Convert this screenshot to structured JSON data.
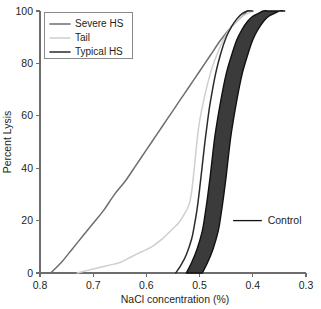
{
  "chart_data": {
    "type": "line",
    "title": "",
    "xlabel": "NaCl concentration (%)",
    "ylabel": "Percent Lysis",
    "xlim": [
      0.8,
      0.3
    ],
    "ylim": [
      0,
      100
    ],
    "x_reversed": true,
    "grid": false,
    "legend_position": "top-left",
    "xticks": [
      "0.8",
      "0.7",
      "0.6",
      "0.5",
      "0.4",
      "0.3"
    ],
    "xtick_values": [
      0.8,
      0.7,
      0.6,
      0.5,
      0.4,
      0.3
    ],
    "yticks": [
      "0",
      "20",
      "40",
      "60",
      "80",
      "100"
    ],
    "ytick_values": [
      0,
      20,
      40,
      60,
      80,
      100
    ],
    "series": [
      {
        "name": "Severe HS",
        "color": "#6e6e6e",
        "x": [
          0.78,
          0.76,
          0.74,
          0.72,
          0.7,
          0.68,
          0.66,
          0.64,
          0.62,
          0.6,
          0.58,
          0.56,
          0.54,
          0.52,
          0.5,
          0.48,
          0.46,
          0.44,
          0.42,
          0.41,
          0.405
        ],
        "values": [
          0,
          4,
          9,
          14,
          19,
          24,
          30,
          35,
          41,
          47,
          53,
          59,
          65,
          71,
          77,
          83,
          89,
          94,
          98,
          100,
          100
        ]
      },
      {
        "name": "Tail",
        "color": "#cfcfcf",
        "x": [
          0.73,
          0.71,
          0.69,
          0.67,
          0.65,
          0.63,
          0.61,
          0.59,
          0.57,
          0.55,
          0.54,
          0.53,
          0.52,
          0.515,
          0.51,
          0.505,
          0.5,
          0.49,
          0.48,
          0.47,
          0.46,
          0.45,
          0.44,
          0.43,
          0.42,
          0.41,
          0.4
        ],
        "values": [
          0,
          1,
          2,
          3,
          4,
          6,
          8,
          10,
          13,
          17,
          19,
          22,
          26,
          31,
          40,
          50,
          58,
          68,
          76,
          82,
          87,
          91,
          94,
          96,
          98,
          99,
          100
        ]
      },
      {
        "name": "Typical HS",
        "color": "#2b2b2b",
        "x": [
          0.545,
          0.535,
          0.525,
          0.515,
          0.51,
          0.505,
          0.5,
          0.495,
          0.49,
          0.485,
          0.48,
          0.47,
          0.46,
          0.45,
          0.44,
          0.43,
          0.42,
          0.41,
          0.4
        ],
        "values": [
          0,
          3,
          7,
          13,
          18,
          24,
          32,
          41,
          50,
          58,
          65,
          76,
          84,
          90,
          94,
          97,
          99,
          100,
          100
        ]
      }
    ],
    "bands": [
      {
        "name": "Control",
        "fill": "#3b3b3b",
        "stroke": "#111111",
        "lower_x": [
          0.525,
          0.515,
          0.505,
          0.495,
          0.49,
          0.485,
          0.48,
          0.475,
          0.47,
          0.46,
          0.45,
          0.44,
          0.43,
          0.42,
          0.41,
          0.4,
          0.39,
          0.38,
          0.37
        ],
        "lower_values": [
          0,
          4,
          9,
          16,
          22,
          29,
          37,
          46,
          54,
          66,
          76,
          83,
          89,
          93,
          96,
          98,
          99,
          100,
          100
        ],
        "upper_x": [
          0.495,
          0.485,
          0.475,
          0.465,
          0.46,
          0.455,
          0.45,
          0.445,
          0.44,
          0.43,
          0.42,
          0.41,
          0.4,
          0.39,
          0.38,
          0.37,
          0.36,
          0.35,
          0.34
        ],
        "upper_values": [
          0,
          4,
          9,
          16,
          22,
          29,
          37,
          46,
          54,
          66,
          76,
          83,
          89,
          93,
          96,
          98,
          99,
          100,
          100
        ]
      }
    ],
    "annotations": [
      {
        "label": "Control",
        "x": 0.372,
        "y": 20,
        "leader_from_x": 0.437,
        "leader_to_x": 0.383
      }
    ]
  },
  "legend": {
    "entries": [
      {
        "label": "Severe HS",
        "color": "#6e6e6e"
      },
      {
        "label": "Tail",
        "color": "#cfcfcf"
      },
      {
        "label": "Typical HS",
        "color": "#2b2b2b"
      }
    ]
  }
}
